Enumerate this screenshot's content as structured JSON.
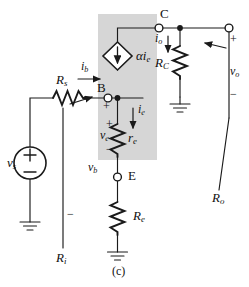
{
  "figure": {
    "caption": "(c)",
    "title_kind": "bjt-common-base-small-signal-equivalent"
  },
  "nodes": {
    "collector": "C",
    "base": "B",
    "emitter": "E"
  },
  "components": {
    "source_resistance": {
      "label": "R",
      "sub": "s"
    },
    "collector_resistance": {
      "label": "R",
      "sub": "C"
    },
    "emitter_internal_resistance": {
      "label": "r",
      "sub": "e"
    },
    "emitter_resistance": {
      "label": "R",
      "sub": "e"
    },
    "dependent_source": {
      "label": "αi",
      "sub": "e"
    },
    "voltage_source": {
      "label": "v",
      "sub": "s"
    }
  },
  "currents": {
    "base_current": {
      "label": "i",
      "sub": "b"
    },
    "emitter_current": {
      "label": "i",
      "sub": "e"
    },
    "output_current": {
      "label": "i",
      "sub": "o"
    }
  },
  "voltages": {
    "emitter_voltage": {
      "label": "v",
      "sub": "e"
    },
    "base_voltage": {
      "label": "v",
      "sub": "b"
    },
    "output_voltage": {
      "label": "v",
      "sub": "o"
    }
  },
  "impedances": {
    "input_resistance": {
      "label": "R",
      "sub": "i"
    },
    "output_resistance": {
      "label": "R",
      "sub": "o"
    }
  },
  "polarity": {
    "plus": "+",
    "minus": "−"
  },
  "colors": {
    "shaded_box": "#d6d6d6",
    "wire": "#1a1a1a",
    "background": "#ffffff",
    "label": "#111111"
  }
}
